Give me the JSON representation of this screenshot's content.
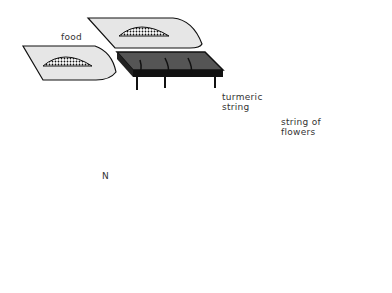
{
  "diagram": {
    "type": "illustration",
    "labels": {
      "food": "food",
      "turmeric_string": "turmeric\nstring",
      "string_of_flowers": "string of\nflowers",
      "north": "N"
    },
    "colors": {
      "leaf_fill": "#e6e6e6",
      "outline": "#111111",
      "dark_platform": "#555555",
      "figure_gray": "#7a7a7a",
      "background": "#ffffff"
    },
    "elements": [
      {
        "name": "food-leaf-top",
        "icon": "leaf-with-food-mound"
      },
      {
        "name": "food-leaf-left",
        "icon": "leaf-with-food-mound"
      },
      {
        "name": "food-leaf-right",
        "icon": "leaf-with-food-mound"
      },
      {
        "name": "food-leaf-center",
        "icon": "leaf-with-food-mound"
      },
      {
        "name": "food-leaf-bottom",
        "icon": "leaf-with-food-mound"
      },
      {
        "name": "dark-platform",
        "icon": "raised-stand"
      },
      {
        "name": "human-figure",
        "icon": "figure-effigy"
      },
      {
        "name": "flower-strings",
        "icon": "flower-garland"
      },
      {
        "name": "compass",
        "icon": "north-arrow"
      }
    ]
  }
}
